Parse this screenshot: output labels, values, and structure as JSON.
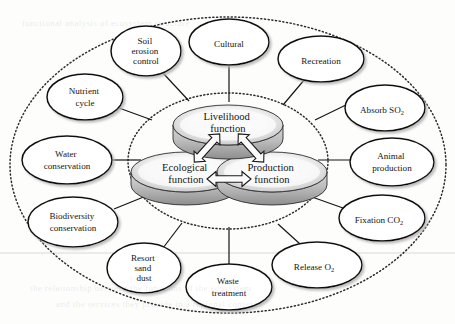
{
  "figure": {
    "core_label_suffix": "function",
    "colors": {
      "ink": "#151515",
      "disc_top": "#f2f2f2",
      "disc_shade": "#9a9a9a",
      "disc_band": "#c9c9c9",
      "outline": "#111111",
      "shadow": "#8d8d8d",
      "dotted_ring": "#2b2b2b",
      "background": "#fdfdfc"
    }
  },
  "core": {
    "nodes": [
      {
        "id": "livelihood",
        "line1": "Livelihood",
        "line2": "function",
        "cx": 228,
        "cy": 128
      },
      {
        "id": "ecological",
        "line1": "Ecological",
        "line2": "function",
        "cx": 186,
        "cy": 175
      },
      {
        "id": "production",
        "line1": "Production",
        "line2": "function",
        "cx": 272,
        "cy": 175
      }
    ],
    "arrows": [
      {
        "id": "ecological-livelihood",
        "from": "ecological",
        "to": "livelihood",
        "style": "double-headed"
      },
      {
        "id": "livelihood-production",
        "from": "livelihood",
        "to": "production",
        "style": "double-headed"
      },
      {
        "id": "ecological-production",
        "from": "ecological",
        "to": "production",
        "style": "double-headed"
      }
    ]
  },
  "outer_nodes": [
    {
      "id": "soil-erosion-control",
      "lines": [
        "Soil",
        "erosion",
        "control"
      ],
      "cx": 146,
      "cy": 51,
      "rx": 35,
      "ry": 25,
      "link": {
        "x1": 162,
        "y1": 72,
        "x2": 189,
        "y2": 101
      }
    },
    {
      "id": "cultural",
      "lines": [
        "Cultural"
      ],
      "cx": 229,
      "cy": 42,
      "rx": 40,
      "ry": 23,
      "link": {
        "x1": 229,
        "y1": 65,
        "x2": 229,
        "y2": 102
      }
    },
    {
      "id": "recreation",
      "lines": [
        "Recreation"
      ],
      "cx": 321,
      "cy": 59,
      "rx": 43,
      "ry": 23,
      "link": {
        "x1": 305,
        "y1": 79,
        "x2": 283,
        "y2": 105
      }
    },
    {
      "id": "absorb-so2",
      "lines": [
        "Absorb SO",
        "2"
      ],
      "cx": 385,
      "cy": 108,
      "rx": 40,
      "ry": 23,
      "link": {
        "x1": 350,
        "y1": 103,
        "x2": 315,
        "y2": 120
      }
    },
    {
      "id": "animal-production",
      "lines": [
        "Animal",
        "production"
      ],
      "cx": 392,
      "cy": 162,
      "rx": 42,
      "ry": 24,
      "link": {
        "x1": 351,
        "y1": 160,
        "x2": 318,
        "y2": 160
      }
    },
    {
      "id": "fixation-co2",
      "lines": [
        "Fixation CO",
        "2"
      ],
      "cx": 382,
      "cy": 218,
      "rx": 43,
      "ry": 23,
      "link": {
        "x1": 343,
        "y1": 208,
        "x2": 312,
        "y2": 197
      }
    },
    {
      "id": "release-o2",
      "lines": [
        "Release O",
        "2"
      ],
      "cx": 317,
      "cy": 265,
      "rx": 45,
      "ry": 23,
      "link": {
        "x1": 300,
        "y1": 244,
        "x2": 278,
        "y2": 224
      }
    },
    {
      "id": "waste-treatment",
      "lines": [
        "Waste",
        "treatment"
      ],
      "cx": 229,
      "cy": 287,
      "rx": 43,
      "ry": 23,
      "link": {
        "x1": 229,
        "y1": 264,
        "x2": 229,
        "y2": 227
      }
    },
    {
      "id": "resort-sand-dust",
      "lines": [
        "Resort",
        "sand",
        "dust"
      ],
      "cx": 144,
      "cy": 268,
      "rx": 37,
      "ry": 25,
      "link": {
        "x1": 163,
        "y1": 248,
        "x2": 182,
        "y2": 223
      }
    },
    {
      "id": "biodiversity-conservation",
      "lines": [
        "Biodiversity",
        "conservation"
      ],
      "cx": 73,
      "cy": 222,
      "rx": 45,
      "ry": 25,
      "link": {
        "x1": 114,
        "y1": 209,
        "x2": 146,
        "y2": 196
      }
    },
    {
      "id": "water-conservation",
      "lines": [
        "Water",
        "conservation"
      ],
      "cx": 67,
      "cy": 160,
      "rx": 45,
      "ry": 24,
      "link": {
        "x1": 112,
        "y1": 160,
        "x2": 141,
        "y2": 160
      }
    },
    {
      "id": "nutrient-cycle",
      "lines": [
        "Nutrient",
        "cycle"
      ],
      "cx": 85,
      "cy": 97,
      "rx": 38,
      "ry": 23,
      "link": {
        "x1": 119,
        "y1": 108,
        "x2": 152,
        "y2": 120
      }
    }
  ],
  "rings": [
    {
      "id": "outer-dotted-ring",
      "cx": 228,
      "cy": 165,
      "rx": 218,
      "ry": 148,
      "style": "dotted"
    },
    {
      "id": "inner-dotted-ring",
      "cx": 228,
      "cy": 161,
      "rx": 100,
      "ry": 68,
      "style": "dotted"
    }
  ],
  "artifacts": {
    "scan_line_y": 253,
    "ghost_lines": [
      {
        "text": "the relationship between the functions of the ecosystem",
        "x": 30,
        "y": 289
      },
      {
        "text": "and the services they provide in a regional context",
        "x": 56,
        "y": 305
      },
      {
        "text": "functional analysis of ecosystem structure",
        "x": 22,
        "y": 24
      }
    ]
  }
}
